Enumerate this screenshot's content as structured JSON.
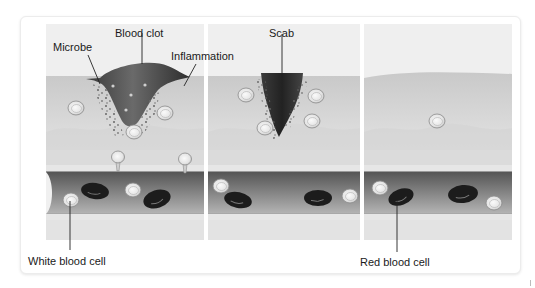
{
  "figure": {
    "panels": [
      {
        "id": "stage-1",
        "name": "Blood clot stage",
        "x": 46,
        "width": 158
      },
      {
        "id": "stage-2",
        "name": "Scab stage",
        "x": 208,
        "width": 152
      },
      {
        "id": "stage-3",
        "name": "Healed stage",
        "x": 364,
        "width": 148
      }
    ],
    "labels": {
      "microbe": "Microbe",
      "blood_clot": "Blood clot",
      "inflammation": "Inflammation",
      "scab": "Scab",
      "white_blood_cell": "White blood cell",
      "red_blood_cell": "Red blood cell"
    },
    "colors": {
      "sky": "#efefef",
      "tissue_top": "#c9c9c9",
      "tissue_bottom": "#e2e2e2",
      "deep_tissue": "#d4d4d4",
      "vessel_wall": "#e6e6e6",
      "vessel_inner": "#555555",
      "vessel_inner_light": "#8a8a8a",
      "clot": "#4a4a4a",
      "scab": "#333333",
      "red_cell": "#1c1c1c",
      "white_cell": "#f2f2f2",
      "label_text": "#1a1a1a",
      "leader_line": "#222222"
    },
    "white_cells_tissue": [
      {
        "cx": 76,
        "cy": 108
      },
      {
        "cx": 165,
        "cy": 113
      },
      {
        "cx": 134,
        "cy": 132
      },
      {
        "cx": 246,
        "cy": 95
      },
      {
        "cx": 316,
        "cy": 96
      },
      {
        "cx": 312,
        "cy": 121
      },
      {
        "cx": 265,
        "cy": 128
      },
      {
        "cx": 437,
        "cy": 121
      }
    ],
    "white_cells_vessel": [
      {
        "cx": 71,
        "cy": 200
      },
      {
        "cx": 133,
        "cy": 190
      },
      {
        "cx": 221,
        "cy": 186
      },
      {
        "cx": 350,
        "cy": 196
      },
      {
        "cx": 380,
        "cy": 188
      },
      {
        "cx": 494,
        "cy": 203
      }
    ],
    "red_cells": [
      {
        "cx": 95,
        "cy": 191,
        "rx": 14,
        "ry": 8,
        "rot": 8
      },
      {
        "cx": 157,
        "cy": 199,
        "rx": 14,
        "ry": 9,
        "rot": -18
      },
      {
        "cx": 238,
        "cy": 200,
        "rx": 14,
        "ry": 8,
        "rot": 12
      },
      {
        "cx": 318,
        "cy": 198,
        "rx": 14,
        "ry": 8,
        "rot": 0
      },
      {
        "cx": 401,
        "cy": 197,
        "rx": 13,
        "ry": 8,
        "rot": -20
      },
      {
        "cx": 463,
        "cy": 194,
        "rx": 15,
        "ry": 9,
        "rot": -6
      }
    ],
    "diapedesis_cells": [
      {
        "cx": 118,
        "cy": 157
      },
      {
        "cx": 185,
        "cy": 159
      }
    ]
  }
}
